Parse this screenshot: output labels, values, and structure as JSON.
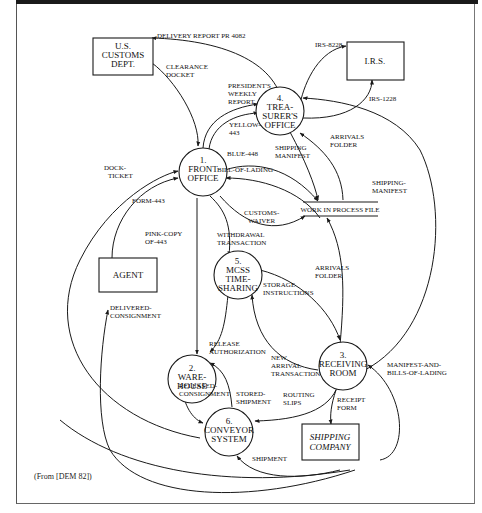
{
  "diagram": {
    "type": "data-flow-diagram",
    "source_note": "(From [DEM 82])",
    "external_entities": [
      {
        "id": "customs",
        "lines": [
          "U.S.",
          "CUSTOMS",
          "DEPT."
        ],
        "italic": false
      },
      {
        "id": "irs",
        "lines": [
          "I.R.S."
        ],
        "italic": false
      },
      {
        "id": "agent",
        "lines": [
          "AGENT"
        ],
        "italic": false
      },
      {
        "id": "shipping",
        "lines": [
          "SHIPPING",
          "COMPANY"
        ],
        "italic": true
      }
    ],
    "processes": [
      {
        "id": "p1",
        "lines": [
          "1.",
          "FRONT",
          "OFFICE"
        ]
      },
      {
        "id": "p2",
        "lines": [
          "2.",
          "WARE-",
          "HOUSE"
        ]
      },
      {
        "id": "p3",
        "lines": [
          "3.",
          "RECEIVING",
          "ROOM"
        ]
      },
      {
        "id": "p4",
        "lines": [
          "4.",
          "TREA-",
          "SURER'S",
          "OFFICE"
        ]
      },
      {
        "id": "p5",
        "lines": [
          "5.",
          "MCSS",
          "TIME-",
          "SHARING"
        ]
      },
      {
        "id": "p6",
        "lines": [
          "6.",
          "CONVEYOR",
          "SYSTEM"
        ]
      }
    ],
    "data_stores": [
      {
        "id": "wip",
        "label": "WORK IN PROCESS FILE"
      }
    ],
    "flows": [
      {
        "id": "f1",
        "lines": [
          "DELIVERY REPORT PR 4082"
        ],
        "from": "p4",
        "to": "customs"
      },
      {
        "id": "f2",
        "lines": [
          "CLEARANCE",
          "DOCKET"
        ],
        "from": "customs",
        "to": "p1"
      },
      {
        "id": "f3",
        "lines": [
          "IRS-8228"
        ],
        "from": "p4",
        "to": "irs"
      },
      {
        "id": "f4",
        "lines": [
          "IRS-1228"
        ],
        "from": "p4",
        "to": "irs"
      },
      {
        "id": "f5",
        "lines": [
          "PRESIDENT'S",
          "WEEKLY",
          "REPORT"
        ],
        "from": "p1",
        "to": "p4"
      },
      {
        "id": "f6",
        "lines": [
          "YELLOW-",
          "443"
        ],
        "from": "p1",
        "to": "p4"
      },
      {
        "id": "f7",
        "lines": [
          "SHIPPING",
          "MANIFEST"
        ],
        "from": "p4",
        "to": "wip"
      },
      {
        "id": "f8",
        "lines": [
          "ARRIVALS",
          "FOLDER"
        ],
        "from": "wip",
        "to": "p4"
      },
      {
        "id": "f9",
        "lines": [
          "BLUE-448"
        ],
        "from": "p1",
        "to": "wip"
      },
      {
        "id": "f10",
        "lines": [
          "BILL-OF-LADING"
        ],
        "from": "wip",
        "to": "p1"
      },
      {
        "id": "f11",
        "lines": [
          "CUSTOMS-",
          "WAIVER"
        ],
        "from": "p1",
        "to": "wip"
      },
      {
        "id": "f12",
        "lines": [
          "SHIPPING-",
          "MANIFEST"
        ],
        "from": "p3",
        "to": "p4"
      },
      {
        "id": "f13",
        "lines": [
          "DOCK-",
          "TICKET"
        ],
        "from": "p6",
        "to": "p1"
      },
      {
        "id": "f14",
        "lines": [
          "FORM-443"
        ],
        "from": "agent",
        "to": "p1"
      },
      {
        "id": "f15",
        "lines": [
          "PINK-COPY",
          "OF-443"
        ],
        "from": "p1",
        "to": "p2"
      },
      {
        "id": "f16",
        "lines": [
          "WITHDRAWAL",
          "TRANSACTION"
        ],
        "from": "p1",
        "to": "p5"
      },
      {
        "id": "f17",
        "lines": [
          "ARRIVALS",
          "FOLDER"
        ],
        "from": "p3",
        "to": "wip"
      },
      {
        "id": "f18",
        "lines": [
          "STORAGE",
          "INSTRUCTIONS"
        ],
        "from": "p5",
        "to": "p3"
      },
      {
        "id": "f19",
        "lines": [
          "DELIVERED-",
          "CONSIGNMENT"
        ],
        "from": "shipping",
        "to": "agent"
      },
      {
        "id": "f20",
        "lines": [
          "RELEASE",
          "AUTHORIZATION"
        ],
        "from": "p5",
        "to": "p2"
      },
      {
        "id": "f21",
        "lines": [
          "NEW",
          "ARRIVAL",
          "TRANSACTION"
        ],
        "from": "p3",
        "to": "p5"
      },
      {
        "id": "f22",
        "lines": [
          "MANIFEST-AND-",
          "BILLS-OF-LADING"
        ],
        "from": "shipping",
        "to": "p3"
      },
      {
        "id": "f23",
        "lines": [
          "RELEASED-",
          "CONSIGNMENT"
        ],
        "from": "p2",
        "to": "p6"
      },
      {
        "id": "f24",
        "lines": [
          "STORED-",
          "SHIPMENT"
        ],
        "from": "p6",
        "to": "p2"
      },
      {
        "id": "f25",
        "lines": [
          "ROUTING",
          "SLIPS"
        ],
        "from": "p3",
        "to": "p6"
      },
      {
        "id": "f26",
        "lines": [
          "RECEIPT",
          "FORM"
        ],
        "from": "p3",
        "to": "shipping"
      },
      {
        "id": "f27",
        "lines": [
          "SHIPMENT"
        ],
        "from": "shipping",
        "to": "p6"
      }
    ]
  }
}
